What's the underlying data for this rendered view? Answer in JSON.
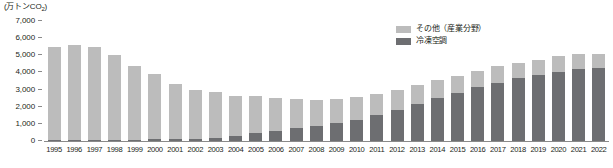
{
  "chart_data": {
    "type": "bar",
    "subtype": "stacked-vertical",
    "title": "",
    "unit_label": "(万トンCO2)",
    "unit_label_main": "(万トンCO",
    "unit_label_sub": "2",
    "unit_label_tail": ")",
    "xlabel": "",
    "ylabel": "",
    "ylim": [
      0,
      7000
    ],
    "ytick_values": [
      7000,
      6000,
      5000,
      4000,
      3000,
      2000,
      1000,
      0
    ],
    "ytick_labels": [
      "7,000",
      "6,000",
      "5,000",
      "4,000",
      "3,000",
      "2,000",
      "1,000",
      "0"
    ],
    "grid": false,
    "legend_position": "top-right",
    "categories": [
      "1995",
      "1996",
      "1997",
      "1998",
      "1999",
      "2000",
      "2001",
      "2002",
      "2003",
      "2004",
      "2005",
      "2006",
      "2007",
      "2008",
      "2009",
      "2010",
      "2011",
      "2012",
      "2013",
      "2014",
      "2015",
      "2016",
      "2017",
      "2018",
      "2019",
      "2020",
      "2021",
      "2022"
    ],
    "series": [
      {
        "name": "冷凍空調",
        "color": "#6d6e71",
        "values": [
          60,
          60,
          60,
          70,
          80,
          90,
          100,
          120,
          150,
          300,
          450,
          600,
          750,
          900,
          1050,
          1250,
          1500,
          1800,
          2150,
          2500,
          2800,
          3150,
          3400,
          3650,
          3850,
          4050,
          4200,
          4250
        ]
      },
      {
        "name": "その他（産業分野）",
        "color": "#bcbcbc",
        "values": [
          5440,
          5540,
          5440,
          4930,
          4270,
          3810,
          3200,
          2880,
          2700,
          2350,
          2150,
          1900,
          1700,
          1500,
          1400,
          1300,
          1250,
          1200,
          1100,
          1050,
          1000,
          950,
          950,
          900,
          900,
          900,
          900,
          850
        ]
      }
    ],
    "totals": [
      5500,
      5600,
      5500,
      5000,
      4350,
      3900,
      3300,
      3000,
      2850,
      2650,
      2600,
      2500,
      2450,
      2400,
      2450,
      2550,
      2750,
      3000,
      3250,
      3550,
      3800,
      4100,
      4350,
      4550,
      4750,
      4950,
      5100,
      5100
    ]
  },
  "legend": {
    "items": [
      {
        "label": "その他（産業分野）",
        "swatch_class": "other"
      },
      {
        "label": "冷凍空調",
        "swatch_class": "refrig"
      }
    ]
  },
  "colors": {
    "other": "#bcbcbc",
    "refrigeration": "#6d6e71",
    "axis": "#8a8a8a",
    "text": "#231f20",
    "background": "#ffffff"
  }
}
